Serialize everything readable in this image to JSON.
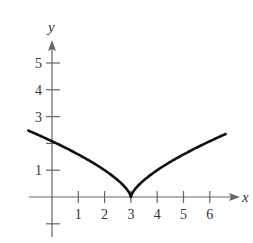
{
  "chart_data": {
    "type": "line",
    "title": "",
    "function": "y = (x - 3)^(2/3)",
    "xlabel": "x",
    "ylabel": "y",
    "xlim": [
      -1,
      7
    ],
    "ylim": [
      -1,
      6
    ],
    "grid": false,
    "x_ticks": [
      1,
      2,
      3,
      4,
      5,
      6
    ],
    "x_tick_labels": [
      "1",
      "2",
      "3",
      "4",
      "5",
      "6"
    ],
    "y_ticks": [
      -1,
      1,
      2,
      3,
      4,
      5
    ],
    "y_tick_labels": [
      "",
      "1",
      "",
      "3",
      "4",
      "5"
    ],
    "series": [
      {
        "name": "curve",
        "x": [
          -0.9,
          0,
          0.5,
          1,
          1.5,
          2,
          2.5,
          2.8,
          3,
          3.2,
          3.5,
          4,
          4.5,
          5,
          5.5,
          6,
          6.6
        ],
        "y": [
          2.48,
          2.08,
          1.84,
          1.59,
          1.31,
          1.0,
          0.63,
          0.34,
          0,
          0.34,
          0.63,
          1.0,
          1.31,
          1.59,
          1.84,
          2.08,
          2.35
        ]
      }
    ]
  }
}
